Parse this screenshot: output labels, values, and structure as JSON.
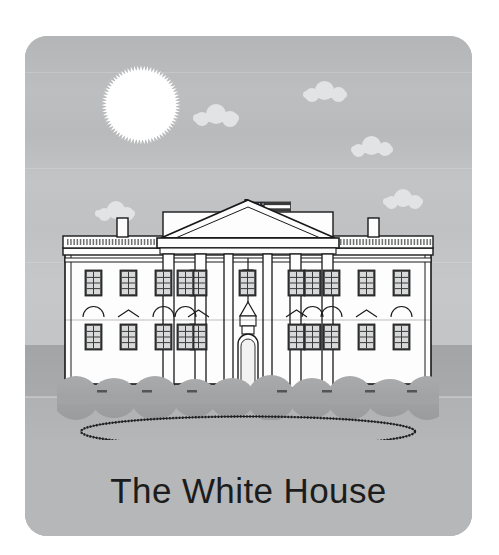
{
  "card": {
    "title": "The White House",
    "title_color": "#1c1c1c",
    "background_color": "#b9babb",
    "corner_radius_px": 22
  },
  "scene": {
    "sky": {
      "label": "sky",
      "top_color": "#b4b5b6",
      "bottom_color": "#c4c5c6",
      "horizon_y": 309
    },
    "sun": {
      "label": "sun",
      "color": "#ffffff",
      "shape": "spiked-disc",
      "spike_count": 72,
      "x": 116,
      "y": 69,
      "radius": 37
    },
    "clouds": [
      {
        "label": "cloud-1",
        "x": 70,
        "y": 165,
        "width": 40,
        "height": 16
      },
      {
        "label": "cloud-2",
        "x": 168,
        "y": 68,
        "width": 46,
        "height": 18
      },
      {
        "label": "cloud-3",
        "x": 278,
        "y": 45,
        "width": 44,
        "height": 17
      },
      {
        "label": "cloud-4",
        "x": 326,
        "y": 100,
        "width": 42,
        "height": 17
      },
      {
        "label": "cloud-5",
        "x": 358,
        "y": 153,
        "width": 40,
        "height": 16
      }
    ],
    "cloud_color": "#e2e3e4",
    "ground": {
      "far_color": "#a5a6a7",
      "near_color": "#b5b6b7",
      "lawn_oval_label": "oval-lawn-outline",
      "lawn_oval_stroke": "#1e1e1e"
    },
    "flag": {
      "label": "american-flag",
      "canton_color": "#2a2a35",
      "stripe_color": "#3a3a3a",
      "field_color": "#ffffff",
      "stripes": 7,
      "star_rows": 5,
      "pole_color": "#1a1a1a"
    },
    "building": {
      "label": "white-house-building",
      "wall_color": "#fdfdfd",
      "outline_color": "#1a1a1a",
      "roof_balustrade_color": "#6e6f70",
      "window_frame_color": "#3a3a3a",
      "window_glass_color": "#d8d9da",
      "chimney_count": 2,
      "portico_column_count": 6,
      "left_wing_windows_per_floor": 4,
      "right_wing_windows_per_floor": 4,
      "floors": 2,
      "bush_color": "#9fa0a1"
    }
  }
}
